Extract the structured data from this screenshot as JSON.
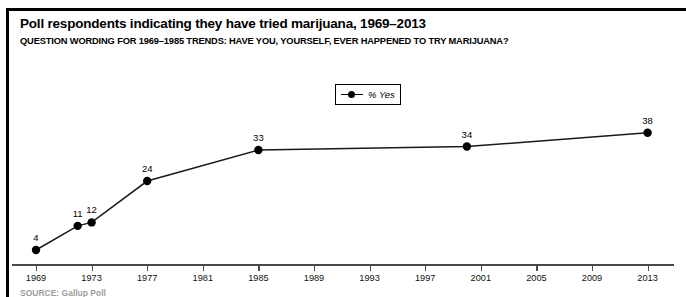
{
  "header": {
    "title": "Poll respondents indicating they have tried marijuana, 1969–2013",
    "subtitle": "QUESTION WORDING FOR 1969–1985 TRENDS: HAVE YOU, YOURSELF, EVER HAPPENED TO TRY MARIJUANA?"
  },
  "legend": {
    "label": "% Yes",
    "marker": "line-dot-marker"
  },
  "footer": {
    "source": "SOURCE: Gallup Poll"
  },
  "colors": {
    "line": "#1a1a1a",
    "marker": "#000000",
    "axis": "#4a4a4a",
    "text": "#000000",
    "background": "#ffffff",
    "frame": "#000000"
  },
  "chart_data": {
    "type": "line",
    "title": "Poll respondents indicating they have tried marijuana, 1969–2013",
    "subtitle": "QUESTION WORDING FOR 1969–1985 TRENDS: HAVE YOU, YOURSELF, EVER HAPPENED TO TRY MARIJUANA?",
    "xlabel": "",
    "ylabel": "",
    "xlim": [
      1967.5,
      2014.5
    ],
    "ylim": [
      0,
      42
    ],
    "grid": false,
    "legend_position": "top-center",
    "series": [
      {
        "name": "% Yes",
        "x": [
          1969,
          1972,
          1973,
          1977,
          1985,
          2000,
          2013
        ],
        "values": [
          4,
          11,
          12,
          24,
          33,
          34,
          38
        ],
        "labels": [
          "4",
          "11",
          "12",
          "24",
          "33",
          "34",
          "38"
        ],
        "marker": "circle",
        "color": "#1a1a1a"
      }
    ],
    "xticks": [
      1969,
      1973,
      1977,
      1981,
      1985,
      1989,
      1993,
      1997,
      2001,
      2005,
      2009,
      2013
    ],
    "xtick_labels": [
      "1969",
      "1973",
      "1977",
      "1981",
      "1985",
      "1989",
      "1993",
      "1997",
      "2001",
      "2005",
      "2009",
      "2013"
    ],
    "yticks": [],
    "ytick_labels": []
  }
}
